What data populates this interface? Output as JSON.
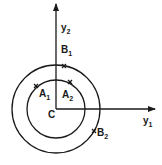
{
  "diagram": {
    "center_label": "C",
    "axes": [
      {
        "id": "y1",
        "label": "y",
        "subscript": "1",
        "direction": "right"
      },
      {
        "id": "y2",
        "label": "y",
        "subscript": "2",
        "direction": "up"
      }
    ],
    "circles": [
      {
        "id": "inner",
        "points": [
          "A1",
          "A2"
        ]
      },
      {
        "id": "outer",
        "points": [
          "B1",
          "B2"
        ]
      }
    ],
    "points": {
      "A1": {
        "label": "A",
        "subscript": "1"
      },
      "A2": {
        "label": "A",
        "subscript": "2"
      },
      "B1": {
        "label": "B",
        "subscript": "1"
      },
      "B2": {
        "label": "B",
        "subscript": "2"
      }
    },
    "colors": {
      "ink": "#1a1a1a",
      "background": "#ffffff"
    }
  }
}
